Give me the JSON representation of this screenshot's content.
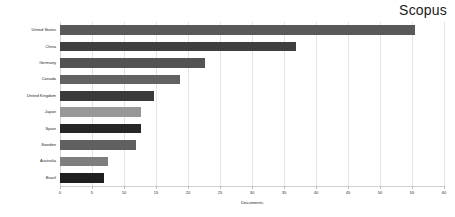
{
  "chart_data": {
    "type": "bar",
    "orientation": "horizontal",
    "title": "Scopus",
    "xlabel": "Documents",
    "ylabel": "",
    "xlim": [
      0,
      60
    ],
    "xticks": [
      0,
      5,
      10,
      15,
      20,
      25,
      30,
      35,
      40,
      45,
      50,
      55,
      60
    ],
    "xtick_labels": [
      "0",
      "5",
      "10",
      "15",
      "20",
      "25",
      "30",
      "35",
      "40",
      "45",
      "50",
      "55",
      "60"
    ],
    "grid": true,
    "grid_axis": "x",
    "legend": false,
    "categories": [
      "United States",
      "China",
      "Germany",
      "Canada",
      "United Kingdom",
      "Japan",
      "Spain",
      "Sweden",
      "Australia",
      "Brazil"
    ],
    "values": [
      55.5,
      36.8,
      22.7,
      18.8,
      14.7,
      12.7,
      12.7,
      11.8,
      7.5,
      6.8
    ],
    "bar_colors": [
      "#595959",
      "#3f3f3f",
      "#535353",
      "#626262",
      "#3a3a3a",
      "#989898",
      "#262626",
      "#606060",
      "#7e7e7e",
      "#1f1f1f"
    ],
    "background_color": "#ffffff",
    "grid_color": "#e3e3e3",
    "axis_color": "#cfcfcf",
    "text_color": "#1f1f1f"
  }
}
